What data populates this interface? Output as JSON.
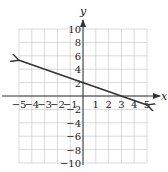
{
  "chart_data": {
    "type": "line",
    "title": "",
    "xlabel": "x",
    "ylabel": "y",
    "xlim": [
      -5,
      5
    ],
    "ylim": [
      -10,
      10
    ],
    "grid": true,
    "x_ticks": [
      -5,
      -4,
      -3,
      -2,
      -1,
      1,
      2,
      3,
      4,
      5
    ],
    "x_tick_labels": [
      "−5",
      "−4",
      "−3",
      "−2",
      "−1",
      "1",
      "2",
      "3",
      "4",
      "5"
    ],
    "y_ticks": [
      -10,
      -8,
      -6,
      -4,
      -2,
      2,
      4,
      6,
      8,
      10
    ],
    "y_tick_labels": [
      "−10",
      "−8",
      "−6",
      "−4",
      "−2",
      "2",
      "4",
      "6",
      "8",
      "10"
    ],
    "series": [
      {
        "name": "line",
        "equation": "y = -2/3 x + 2",
        "x": [
          -5,
          5
        ],
        "y": [
          5.33,
          -1.33
        ],
        "arrows": "both",
        "color": "#333333"
      }
    ]
  },
  "colors": {
    "grid": "#d0d0d0",
    "axis": "#333333",
    "line": "#333333"
  }
}
